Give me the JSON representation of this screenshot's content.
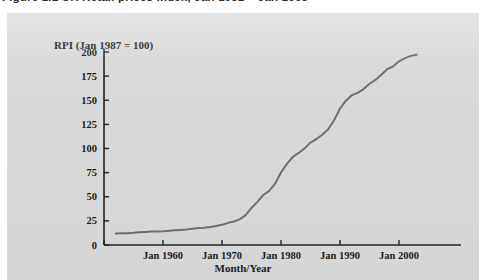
{
  "caption": {
    "text": "Figure 1.1  UK Retail prices index, Jan 1952 – Jan 2003"
  },
  "chart_data": {
    "type": "line",
    "title": "",
    "ylabel": "RPI (Jan 1987 = 100)",
    "xlabel": "Month/Year",
    "ylim": [
      0,
      200
    ],
    "xlim": [
      1950,
      2005
    ],
    "grid": false,
    "legend": null,
    "y_ticks": [
      "0",
      "25",
      "50",
      "75",
      "100",
      "125",
      "150",
      "175",
      "200"
    ],
    "y_tick_values": [
      0,
      25,
      50,
      75,
      100,
      125,
      150,
      175,
      200
    ],
    "x_ticks": [
      "",
      "Jan 1960",
      "Jan 1970",
      "Jan 1980",
      "Jan 1990",
      "Jan 2000"
    ],
    "x_tick_values": [
      1950,
      1960,
      1970,
      1980,
      1990,
      2000
    ],
    "series": [
      {
        "name": "RPI",
        "color": "#6f6f6f",
        "x": [
          1952,
          1953,
          1954,
          1955,
          1956,
          1957,
          1958,
          1959,
          1960,
          1961,
          1962,
          1963,
          1964,
          1965,
          1966,
          1967,
          1968,
          1969,
          1970,
          1971,
          1972,
          1973,
          1974,
          1975,
          1976,
          1977,
          1978,
          1979,
          1980,
          1981,
          1982,
          1983,
          1984,
          1985,
          1986,
          1987,
          1988,
          1989,
          1990,
          1991,
          1992,
          1993,
          1994,
          1995,
          1996,
          1997,
          1998,
          1999,
          2000,
          2001,
          2002,
          2003
        ],
        "values": [
          11.8,
          12.1,
          12.3,
          12.6,
          13.1,
          13.6,
          14.0,
          14.1,
          14.3,
          14.7,
          15.3,
          15.6,
          16.0,
          16.8,
          17.5,
          17.9,
          18.7,
          19.7,
          20.9,
          22.9,
          24.4,
          26.6,
          30.9,
          38.4,
          44.7,
          51.8,
          56.1,
          63.6,
          75.1,
          84.0,
          91.2,
          95.4,
          100.1,
          106.2,
          109.8,
          114.3,
          119.9,
          129.2,
          141.4,
          149.6,
          155.2,
          157.7,
          161.6,
          167.1,
          171.1,
          176.4,
          182.2,
          185.0,
          190.3,
          193.6,
          196.0,
          197.2
        ]
      }
    ]
  },
  "geometry": {
    "note": "pixel mapping for axis rendering",
    "x_axis_pixels": {
      "x0": 104,
      "x_end": 461,
      "px_per_decade": 59,
      "year0": 1950
    },
    "y_axis_pixels": {
      "y_zero": 245,
      "y_top": 52,
      "px_per_25": 24.125
    }
  }
}
